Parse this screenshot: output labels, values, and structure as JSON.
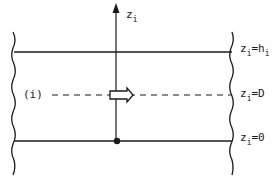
{
  "diagram": {
    "axis_label": {
      "main": "z",
      "sub": "i"
    },
    "layer_label": "(i)",
    "levels": [
      {
        "name": "top",
        "main": "z",
        "sub": "i",
        "eq": "=h",
        "eq_sub": "i"
      },
      {
        "name": "middle",
        "main": "z",
        "sub": "i",
        "eq": "=D",
        "eq_sub": ""
      },
      {
        "name": "bottom",
        "main": "z",
        "sub": "i",
        "eq": "=0",
        "eq_sub": ""
      }
    ],
    "colors": {
      "ink": "#1a1a1a",
      "background": "#ffffff"
    }
  }
}
